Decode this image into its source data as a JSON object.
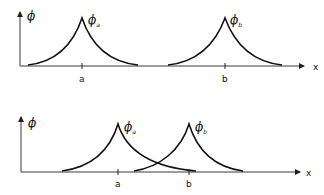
{
  "diagram": {
    "colors": {
      "line": "#111111",
      "axis": "#3a3a3a",
      "background": "#ffffff"
    },
    "top_panel": {
      "y_axis_label": "ϕ",
      "x_axis_label": "x",
      "peaks": [
        {
          "label": "ϕ",
          "subscript": "a",
          "position_label": "a"
        },
        {
          "label": "ϕ",
          "subscript": "b",
          "position_label": "b"
        }
      ],
      "note": "peaks well separated, no overlap"
    },
    "bottom_panel": {
      "y_axis_label": "ϕ",
      "x_axis_label": "x",
      "peaks": [
        {
          "label": "ϕ",
          "subscript": "a",
          "position_label": "a"
        },
        {
          "label": "ϕ",
          "subscript": "b",
          "position_label": "b"
        }
      ],
      "note": "peaks close together, tails overlap between a and b"
    }
  }
}
